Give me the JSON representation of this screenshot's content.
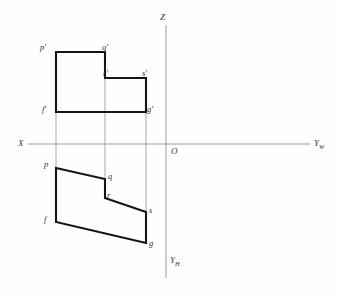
{
  "diagram": {
    "type": "orthographic-projection",
    "background_color": "#fefefe",
    "outline_color": "#151515",
    "axis_color": "#9a9a9a",
    "projection_line_color": "#a8a8a8"
  },
  "axes": {
    "origin": {
      "label": "O",
      "x": 166,
      "y": 144
    },
    "z_axis": {
      "label": "Z",
      "x1": 166,
      "y1": 25,
      "x2": 166,
      "y2": 144,
      "label_x": 160,
      "label_y": 13
    },
    "x_axis": {
      "label": "X",
      "x1": 28,
      "y1": 144,
      "x2": 166,
      "y2": 144,
      "label_x": 18,
      "label_y": 140
    },
    "yw_axis": {
      "label": "Y",
      "sub": "W",
      "x1": 166,
      "y1": 144,
      "x2": 310,
      "y2": 144,
      "label_x": 314,
      "label_y": 141
    },
    "yh_axis": {
      "label": "Y",
      "sub": "H",
      "x1": 166,
      "y1": 144,
      "x2": 166,
      "y2": 278,
      "label_x": 170,
      "label_y": 257
    },
    "origin_label_x": 171,
    "origin_label_y": 147
  },
  "front_view": {
    "name": "V-projection (front view)",
    "path": "M56,52 L105,52 L105,78 L146,78 L146,112 L56,112 Z",
    "vertices": [
      {
        "id": "p-prime",
        "label": "p'",
        "x": 56,
        "y": 52,
        "label_x": 40,
        "label_y": 43
      },
      {
        "id": "q-prime",
        "label": "q'",
        "x": 105,
        "y": 52,
        "label_x": 102,
        "label_y": 43
      },
      {
        "id": "r-prime",
        "label": "r'",
        "x": 105,
        "y": 78,
        "label_x": 103,
        "label_y": 69
      },
      {
        "id": "s-prime",
        "label": "s'",
        "x": 146,
        "y": 78,
        "label_x": 142,
        "label_y": 69
      },
      {
        "id": "g-prime",
        "label": "g'",
        "x": 146,
        "y": 112,
        "label_x": 146,
        "label_y": 106
      },
      {
        "id": "f-prime",
        "label": "f'",
        "x": 56,
        "y": 112,
        "label_x": 42,
        "label_y": 106
      }
    ]
  },
  "top_view": {
    "name": "H-projection (top view)",
    "path": "M56,168 L105,179 L105,198 L146,212 L146,243 L56,222 Z",
    "vertices": [
      {
        "id": "p",
        "label": "p",
        "x": 56,
        "y": 168,
        "label_x": 44,
        "label_y": 160
      },
      {
        "id": "q",
        "label": "q",
        "x": 105,
        "y": 179,
        "label_x": 108,
        "label_y": 173
      },
      {
        "id": "r",
        "label": "r",
        "x": 105,
        "y": 198,
        "label_x": 107,
        "label_y": 192
      },
      {
        "id": "s",
        "label": "s",
        "x": 146,
        "y": 212,
        "label_x": 149,
        "label_y": 207
      },
      {
        "id": "g",
        "label": "g",
        "x": 146,
        "y": 243,
        "label_x": 149,
        "label_y": 240
      },
      {
        "id": "f",
        "label": "f",
        "x": 56,
        "y": 222,
        "label_x": 44,
        "label_y": 216
      }
    ]
  },
  "projection_lines": [
    {
      "id": "proj-p",
      "x1": 56,
      "y1": 52,
      "x2": 56,
      "y2": 222
    },
    {
      "id": "proj-q",
      "x1": 105,
      "y1": 78,
      "x2": 105,
      "y2": 179
    },
    {
      "id": "proj-s",
      "x1": 146,
      "y1": 78,
      "x2": 146,
      "y2": 243
    }
  ]
}
